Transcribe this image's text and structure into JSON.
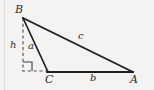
{
  "figure": {
    "kind": "geometry-diagram",
    "background_color": "#f4f3f1",
    "ink_color": "#1f1f1f",
    "dash_color": "#5a5a5a",
    "width": 154,
    "height": 90
  },
  "vertices": [
    {
      "id": "B",
      "label": "B",
      "x": 23,
      "y": 18
    },
    {
      "id": "C",
      "label": "C",
      "x": 48,
      "y": 72
    },
    {
      "id": "A",
      "label": "A",
      "x": 133,
      "y": 72
    }
  ],
  "sides": [
    {
      "id": "a",
      "label": "a",
      "from": "B",
      "to": "C"
    },
    {
      "id": "b",
      "label": "b",
      "from": "C",
      "to": "A"
    },
    {
      "id": "c",
      "label": "c",
      "from": "B",
      "to": "A"
    }
  ],
  "altitude": {
    "label": "h",
    "from": "B",
    "foot_x": 23,
    "foot_y": 71,
    "style": "dashed",
    "note": "perpendicular dropped from B to the extension of line CA"
  },
  "extension": {
    "from_x": 23,
    "from_y": 71,
    "to_x": 48,
    "to_y": 71,
    "style": "dashed",
    "note": "dashed extension of base CA beyond C to meet the altitude foot"
  },
  "right_angle_marker": {
    "name": "right-angle-square",
    "x": 23,
    "y": 62,
    "size": 9
  },
  "labels": {
    "B": "B",
    "C": "C",
    "A": "A",
    "a": "a",
    "b": "b",
    "c": "c",
    "h": "h"
  }
}
